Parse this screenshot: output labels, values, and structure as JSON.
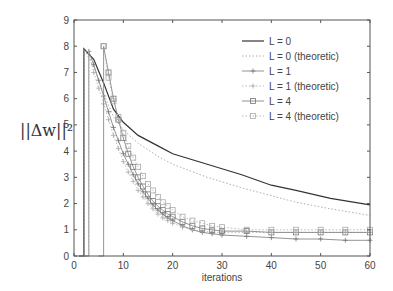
{
  "chart_data": {
    "type": "line",
    "title": "",
    "xlabel": "iterations",
    "ylabel": "||Δw||²",
    "xlim": [
      0,
      60
    ],
    "ylim": [
      0,
      9
    ],
    "xticks": [
      "0",
      "10",
      "20",
      "30",
      "40",
      "50",
      "60"
    ],
    "yticks": [
      "0",
      "1",
      "2",
      "3",
      "4",
      "5",
      "6",
      "7",
      "8",
      "9"
    ],
    "grid": false,
    "legend_position": "upper right",
    "series": [
      {
        "name": "L = 0",
        "style": "solid",
        "marker": "none",
        "x": [
          1,
          2,
          2,
          4,
          6,
          8,
          10,
          13,
          17,
          20,
          27,
          34,
          40,
          45,
          52,
          60
        ],
        "y": [
          0,
          0,
          7.9,
          7.5,
          6.6,
          5.6,
          5.1,
          4.6,
          4.2,
          3.9,
          3.5,
          3.1,
          2.7,
          2.5,
          2.2,
          1.95
        ]
      },
      {
        "name": "L = 0 (theoretic)",
        "style": "dotted",
        "marker": "none",
        "x": [
          1,
          2,
          2,
          4,
          6,
          8,
          10,
          13,
          17,
          20,
          27,
          34,
          40,
          45,
          52,
          60
        ],
        "y": [
          0,
          0,
          7.9,
          7.2,
          6.2,
          5.3,
          4.8,
          4.3,
          3.8,
          3.5,
          3.0,
          2.6,
          2.3,
          2.05,
          1.8,
          1.55
        ]
      },
      {
        "name": "L = 1",
        "style": "solid",
        "marker": "plus",
        "x": [
          2,
          3,
          3,
          4,
          5,
          6,
          7,
          8,
          9,
          10,
          11,
          12,
          13,
          14,
          15,
          16,
          17,
          18,
          19,
          20,
          22,
          24,
          26,
          28,
          30,
          35,
          40,
          45,
          50,
          55,
          60
        ],
        "y": [
          0,
          0,
          7.8,
          7.3,
          6.7,
          6.1,
          5.5,
          4.9,
          4.4,
          3.9,
          3.5,
          3.1,
          2.75,
          2.45,
          2.2,
          1.95,
          1.75,
          1.6,
          1.45,
          1.35,
          1.15,
          1.0,
          0.9,
          0.85,
          0.8,
          0.75,
          0.7,
          0.65,
          0.65,
          0.6,
          0.6
        ]
      },
      {
        "name": "L = 1 (theoretic)",
        "style": "dotted",
        "marker": "plus",
        "x": [
          2,
          3,
          3,
          4,
          5,
          6,
          7,
          8,
          9,
          10,
          11,
          12,
          13,
          14,
          15,
          16,
          17,
          18,
          19,
          20,
          22,
          24,
          26,
          28,
          30,
          35,
          40,
          45,
          50,
          55,
          60
        ],
        "y": [
          0,
          0,
          7.8,
          7.0,
          6.4,
          5.8,
          5.2,
          4.6,
          4.1,
          3.6,
          3.2,
          2.85,
          2.5,
          2.25,
          2.0,
          1.8,
          1.6,
          1.45,
          1.35,
          1.25,
          1.1,
          1.0,
          0.95,
          0.9,
          0.9,
          0.9,
          0.9,
          0.9,
          0.9,
          0.9,
          0.9
        ]
      },
      {
        "name": "L = 4",
        "style": "solid",
        "marker": "square",
        "x": [
          5,
          6,
          6,
          7,
          8,
          9,
          10,
          11,
          12,
          13,
          14,
          15,
          16,
          17,
          18,
          19,
          20,
          22,
          24,
          26,
          28,
          30,
          35,
          40,
          45,
          50,
          55,
          60
        ],
        "y": [
          0,
          0,
          8.0,
          7.0,
          6.0,
          5.2,
          4.5,
          3.9,
          3.4,
          3.0,
          2.65,
          2.35,
          2.1,
          1.9,
          1.75,
          1.6,
          1.5,
          1.3,
          1.15,
          1.05,
          1.0,
          0.95,
          0.95,
          0.9,
          0.9,
          0.9,
          0.9,
          0.9
        ]
      },
      {
        "name": "L = 4 (theoretic)",
        "style": "dotted",
        "marker": "square",
        "x": [
          5,
          6,
          6,
          7,
          8,
          9,
          10,
          11,
          12,
          13,
          14,
          15,
          16,
          17,
          18,
          19,
          20,
          22,
          24,
          26,
          28,
          30,
          35,
          40,
          45,
          50,
          55,
          60
        ],
        "y": [
          0,
          0,
          8.0,
          6.8,
          5.9,
          5.3,
          4.7,
          4.2,
          3.75,
          3.4,
          3.05,
          2.75,
          2.5,
          2.25,
          2.05,
          1.9,
          1.75,
          1.5,
          1.35,
          1.25,
          1.15,
          1.1,
          1.0,
          1.0,
          1.0,
          1.0,
          1.0,
          1.0
        ]
      }
    ]
  }
}
